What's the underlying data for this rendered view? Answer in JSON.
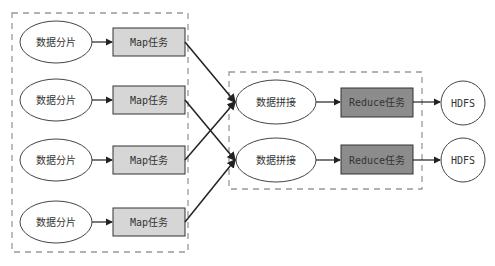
{
  "diagram": {
    "colors": {
      "map_fill": "#d6d6d6",
      "reduce_fill": "#8c8c8c",
      "stroke": "#222222",
      "dashed": "#999999"
    },
    "map_stage": {
      "rows": [
        {
          "split_label": "数据分片",
          "task_label": "Map任务"
        },
        {
          "split_label": "数据分片",
          "task_label": "Map任务"
        },
        {
          "split_label": "数据分片",
          "task_label": "Map任务"
        },
        {
          "split_label": "数据分片",
          "task_label": "Map任务"
        }
      ]
    },
    "reduce_stage": {
      "rows": [
        {
          "merge_label": "数据拼接",
          "task_label": "Reduce任务",
          "output_label": "HDFS"
        },
        {
          "merge_label": "数据拼接",
          "task_label": "Reduce任务",
          "output_label": "HDFS"
        }
      ]
    }
  }
}
